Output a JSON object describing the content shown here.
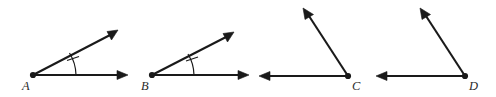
{
  "figure": {
    "background_color": "#ffffff",
    "stroke_color": "#1a1a1a",
    "label_color": "#2b2b2b",
    "width": 496,
    "height": 97,
    "angles": [
      {
        "id": "angle-a",
        "vertex_label": "A",
        "vertex": {
          "x": 33,
          "y": 75
        },
        "label_pos": {
          "x": 22,
          "y": 90
        },
        "has_angle_mark": true,
        "angle_mark_ticks": 1,
        "rays": [
          {
            "name": "ray-a-upper",
            "to": {
              "x": 116,
              "y": 32
            },
            "arrow": "end"
          },
          {
            "name": "ray-a-horizontal",
            "to": {
              "x": 127,
              "y": 75
            },
            "arrow": "end"
          }
        ]
      },
      {
        "id": "angle-b",
        "vertex_label": "B",
        "vertex": {
          "x": 152,
          "y": 75
        },
        "label_pos": {
          "x": 141,
          "y": 90
        },
        "has_angle_mark": true,
        "angle_mark_ticks": 1,
        "rays": [
          {
            "name": "ray-b-upper",
            "to": {
              "x": 232,
              "y": 34
            },
            "arrow": "end"
          },
          {
            "name": "ray-b-horizontal",
            "to": {
              "x": 248,
              "y": 75
            },
            "arrow": "end"
          }
        ]
      },
      {
        "id": "angle-c",
        "vertex_label": "C",
        "vertex": {
          "x": 348,
          "y": 76
        },
        "label_pos": {
          "x": 352,
          "y": 90
        },
        "has_angle_mark": false,
        "angle_mark_ticks": 0,
        "rays": [
          {
            "name": "ray-c-upper",
            "to": {
              "x": 305,
              "y": 10
            },
            "arrow": "end"
          },
          {
            "name": "ray-c-left",
            "to": {
              "x": 260,
              "y": 76
            },
            "arrow": "end"
          }
        ]
      },
      {
        "id": "angle-d",
        "vertex_label": "D",
        "vertex": {
          "x": 465,
          "y": 76
        },
        "label_pos": {
          "x": 469,
          "y": 90
        },
        "has_angle_mark": false,
        "angle_mark_ticks": 0,
        "rays": [
          {
            "name": "ray-d-upper",
            "to": {
              "x": 422,
              "y": 10
            },
            "arrow": "end"
          },
          {
            "name": "ray-d-left",
            "to": {
              "x": 376,
              "y": 76
            },
            "arrow": "end"
          }
        ]
      }
    ]
  }
}
